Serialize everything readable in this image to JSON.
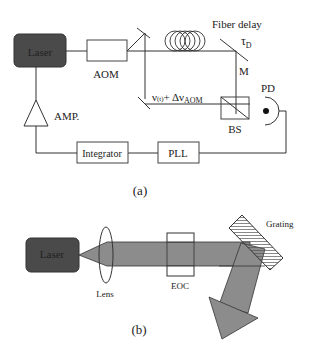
{
  "panel_a": {
    "caption": "(a)",
    "laser_label": "Laser",
    "aom_label": "AOM",
    "fiber_delay_label": "Fiber delay",
    "tau_label": "τ",
    "tau_sub": "D",
    "mirror_label": "M",
    "pd_label": "PD",
    "bs_label": "BS",
    "freq_label_main": "ν",
    "freq_label_t": "(t)",
    "freq_label_plus": "+ Δν",
    "freq_label_sub": "AOM",
    "amp_label": "AMP.",
    "integrator_label": "Integrator",
    "pll_label": "PLL"
  },
  "panel_b": {
    "caption": "(b)",
    "laser_label": "Laser",
    "lens_label": "Lens",
    "eoc_label": "EOC",
    "grating_label": "Grating"
  },
  "colors": {
    "laser_fill": "#4a4a4a",
    "beam_fill": "#8c8c8c",
    "line": "#333333"
  }
}
